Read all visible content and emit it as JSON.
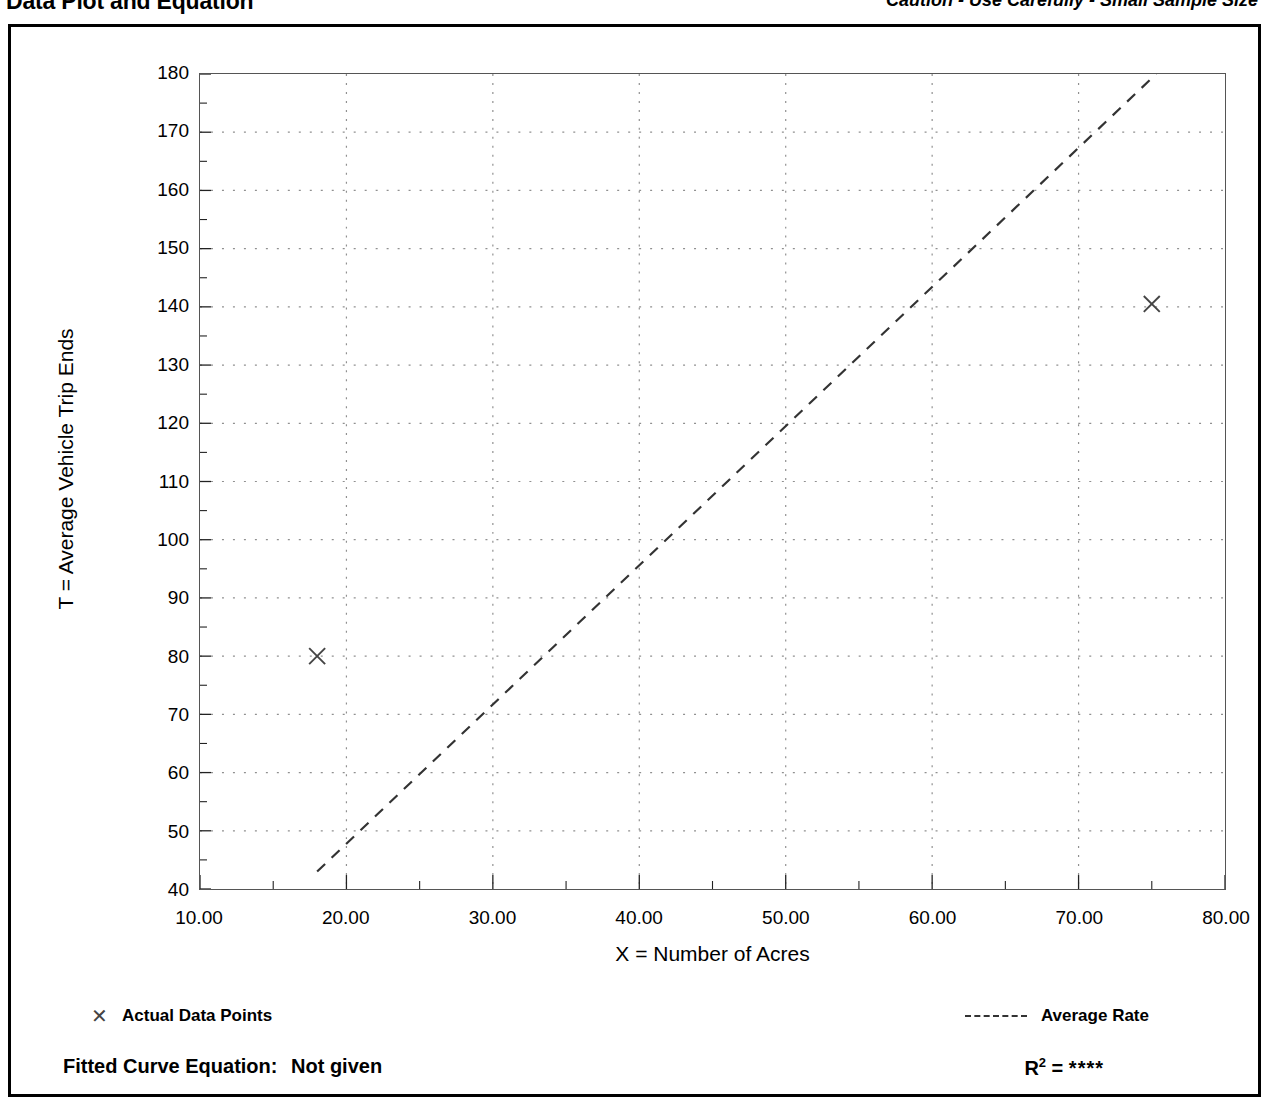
{
  "header": {
    "title": "Data Plot and Equation",
    "caution": "Caution - Use Carefully - Small Sample Size"
  },
  "legend": {
    "points_marker": "✕",
    "points_label": "Actual Data Points",
    "rate_label": "Average Rate"
  },
  "equation": {
    "fitted_label": "Fitted Curve Equation:",
    "fitted_value": "Not given",
    "r_label": "R",
    "r_exponent": "2",
    "r_equals": " = ",
    "r_value": "****"
  },
  "chart_data": {
    "type": "scatter",
    "title": "Data Plot and Equation",
    "subtitle": "Caution - Use Carefully - Small Sample Size",
    "xlabel": "X = Number of Acres",
    "ylabel": "T = Average Vehicle Trip Ends",
    "xlim": [
      10.0,
      80.0
    ],
    "ylim": [
      40,
      180
    ],
    "xticks": [
      10.0,
      20.0,
      30.0,
      40.0,
      50.0,
      60.0,
      70.0,
      80.0
    ],
    "xtick_labels": [
      "10.00",
      "20.00",
      "30.00",
      "40.00",
      "50.00",
      "60.00",
      "70.00",
      "80.00"
    ],
    "yticks": [
      40,
      50,
      60,
      70,
      80,
      90,
      100,
      110,
      120,
      130,
      140,
      150,
      160,
      170,
      180
    ],
    "ytick_labels": [
      "40",
      "50",
      "60",
      "70",
      "80",
      "90",
      "100",
      "110",
      "120",
      "130",
      "140",
      "150",
      "160",
      "170",
      "180"
    ],
    "y_minor_ticks": [
      45,
      55,
      65,
      75,
      85,
      95,
      105,
      115,
      125,
      135,
      145,
      155,
      165,
      175
    ],
    "x_minor_ticks": [
      15.0,
      25.0,
      35.0,
      45.0,
      55.0,
      65.0,
      75.0
    ],
    "grid": "dotted",
    "legend_position": "below-plot",
    "series": [
      {
        "name": "Actual Data Points",
        "type": "scatter",
        "marker": "x",
        "color": "#444444",
        "points": [
          {
            "x": 18.0,
            "y": 80.0
          },
          {
            "x": 75.0,
            "y": 140.5
          }
        ]
      },
      {
        "name": "Average Rate",
        "type": "line",
        "style": "dashed",
        "color": "#333333",
        "points": [
          {
            "x": 18.0,
            "y": 43.0
          },
          {
            "x": 75.3,
            "y": 180.0
          }
        ]
      }
    ],
    "r_squared": "****",
    "fitted_curve_equation": "Not given"
  }
}
